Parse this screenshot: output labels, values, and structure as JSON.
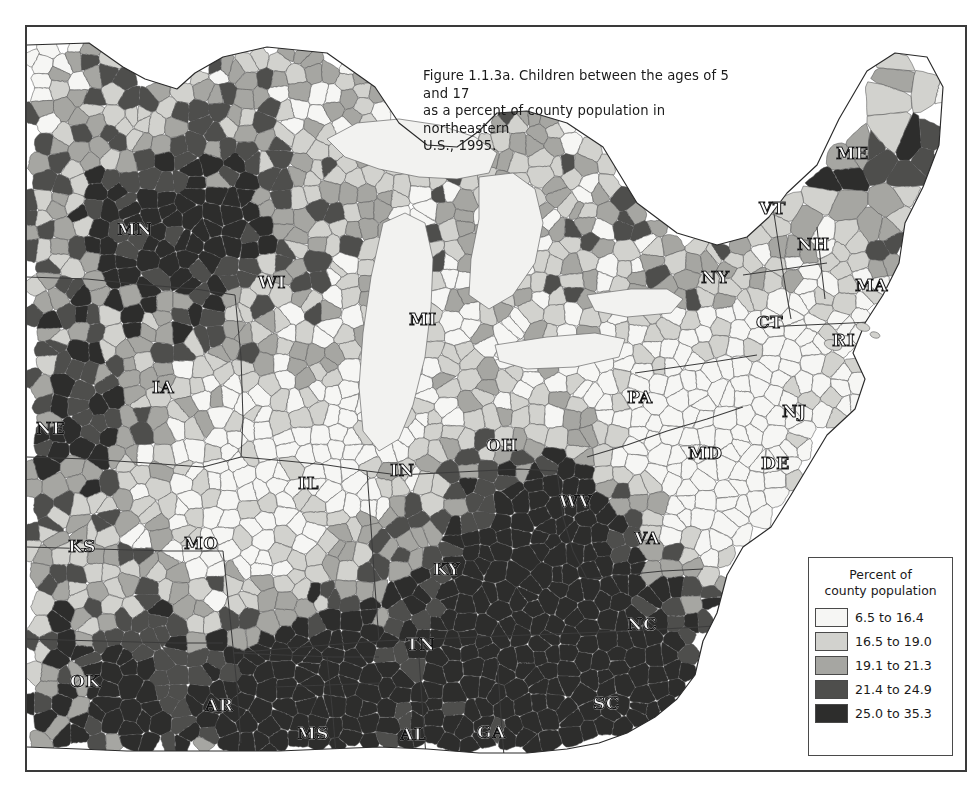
{
  "figure": {
    "title": "Figure 1.1.3a. Children between the ages of 5 and 17\nas a percent of county population in northeastern\nU.S., 1995.",
    "frame_color": "#3a3a3a",
    "background": "#ffffff"
  },
  "legend": {
    "title": "Percent of\ncounty population",
    "classes": [
      {
        "label": "6.5 to 16.4",
        "color": "#f6f6f4",
        "min": 6.5,
        "max": 16.4
      },
      {
        "label": "16.5 to 19.0",
        "color": "#d2d2ce",
        "min": 16.5,
        "max": 19.0
      },
      {
        "label": "19.1 to 21.3",
        "color": "#a6a6a2",
        "min": 19.1,
        "max": 21.3
      },
      {
        "label": "21.4 to 24.9",
        "color": "#4e4e4c",
        "min": 21.4,
        "max": 24.9
      },
      {
        "label": "25.0 to 35.3",
        "color": "#2d2d2c",
        "min": 25.0,
        "max": 35.3
      }
    ]
  },
  "map": {
    "type": "choropleth",
    "unit": "county",
    "region": "northeastern United States",
    "year": 1995,
    "variable": "Children ages 5-17 as percent of county population",
    "water_color": "#f2f2f0",
    "border_color": "#555555",
    "state_labels": [
      {
        "code": "MN",
        "x": 128,
        "y": 228
      },
      {
        "code": "WI",
        "x": 269,
        "y": 281
      },
      {
        "code": "MI",
        "x": 420,
        "y": 318
      },
      {
        "code": "IA",
        "x": 163,
        "y": 386
      },
      {
        "code": "NE",
        "x": 47,
        "y": 427
      },
      {
        "code": "KS",
        "x": 79,
        "y": 545
      },
      {
        "code": "MO",
        "x": 195,
        "y": 542
      },
      {
        "code": "IL",
        "x": 309,
        "y": 482
      },
      {
        "code": "IN",
        "x": 401,
        "y": 469
      },
      {
        "code": "OH",
        "x": 497,
        "y": 444
      },
      {
        "code": "KY",
        "x": 444,
        "y": 568
      },
      {
        "code": "WV",
        "x": 570,
        "y": 500
      },
      {
        "code": "VA",
        "x": 645,
        "y": 537
      },
      {
        "code": "PA",
        "x": 638,
        "y": 396
      },
      {
        "code": "MD",
        "x": 699,
        "y": 452
      },
      {
        "code": "DE",
        "x": 772,
        "y": 462
      },
      {
        "code": "NJ",
        "x": 793,
        "y": 410
      },
      {
        "code": "NY",
        "x": 712,
        "y": 276
      },
      {
        "code": "CT",
        "x": 767,
        "y": 321
      },
      {
        "code": "RI",
        "x": 843,
        "y": 339
      },
      {
        "code": "MA",
        "x": 866,
        "y": 284
      },
      {
        "code": "NH",
        "x": 808,
        "y": 243
      },
      {
        "code": "VT",
        "x": 770,
        "y": 207
      },
      {
        "code": "ME",
        "x": 847,
        "y": 152
      },
      {
        "code": "NC",
        "x": 638,
        "y": 623
      },
      {
        "code": "SC",
        "x": 604,
        "y": 702
      },
      {
        "code": "GA",
        "x": 488,
        "y": 731
      },
      {
        "code": "AL",
        "x": 411,
        "y": 733
      },
      {
        "code": "MS",
        "x": 308,
        "y": 732
      },
      {
        "code": "TN",
        "x": 417,
        "y": 643
      },
      {
        "code": "AR",
        "x": 216,
        "y": 704
      },
      {
        "code": "OK",
        "x": 81,
        "y": 680
      }
    ]
  }
}
